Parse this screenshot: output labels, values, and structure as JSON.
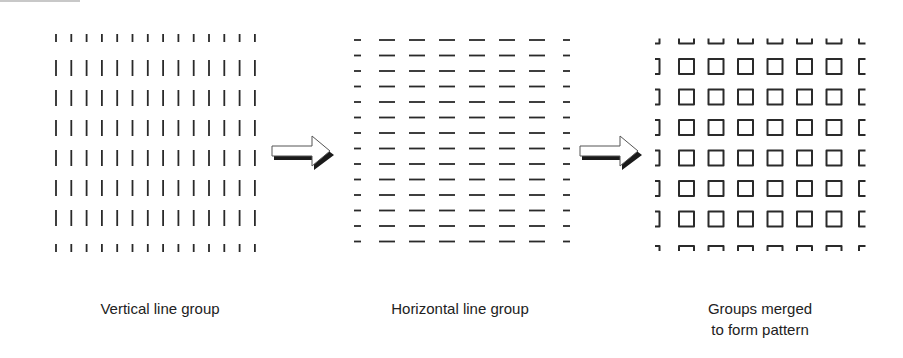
{
  "figure": {
    "panels": [
      {
        "id": "vertical",
        "caption": "Vertical line group",
        "element": "vertical-line",
        "columns": 14,
        "rows": 8
      },
      {
        "id": "horizontal",
        "caption": "Horizontal line group",
        "element": "horizontal-line",
        "columns": 8,
        "rows": 14
      },
      {
        "id": "merged",
        "caption_line1": "Groups merged",
        "caption_line2": "to form pattern",
        "element": "square",
        "columns": 8,
        "rows": 8
      }
    ],
    "arrows": [
      {
        "from": "vertical",
        "to": "horizontal",
        "icon": "right-arrow-icon"
      },
      {
        "from": "horizontal",
        "to": "merged",
        "icon": "right-arrow-icon"
      }
    ],
    "colors": {
      "stroke": "#2a2a2a",
      "arrow_fill": "#ffffff",
      "arrow_shadow": "#1a1a1a",
      "text": "#222222"
    }
  }
}
